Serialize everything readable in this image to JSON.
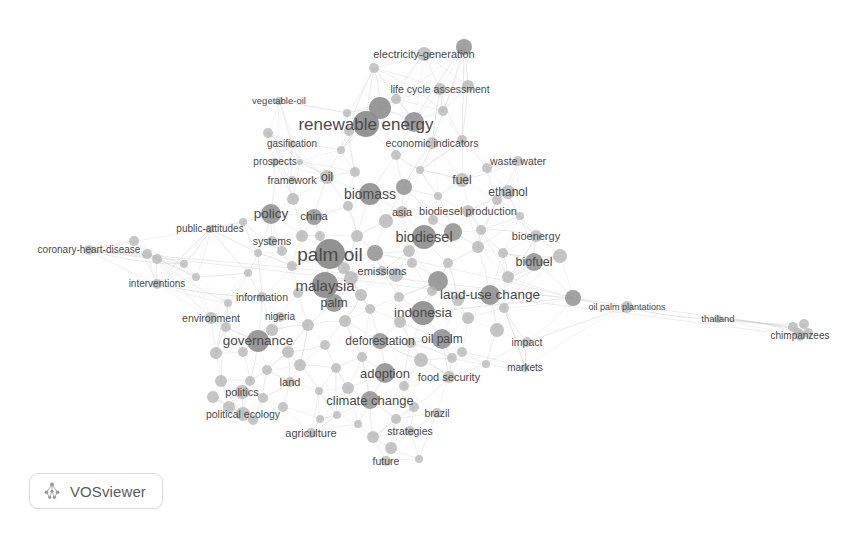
{
  "app": {
    "name": "VOSviewer",
    "badge_label": "VOSviewer",
    "badge_icon": "vosviewer-logo-icon",
    "view_type": "network-visualization",
    "background_color": "#ffffff"
  },
  "chart_data": {
    "type": "scatter",
    "title": "",
    "subtitle": "",
    "xlabel": "",
    "ylabel": "",
    "grid": false,
    "legend_position": "none",
    "axis_visible": false,
    "colors": {
      "node_fill": "#8e8e8e",
      "node_fill_light": "#b4b4b4",
      "edge": "#c9c9c9",
      "label_text": "#4a4a4a",
      "background": "#ffffff"
    },
    "map_notes": "Bibliometric co-occurrence network of palm oil research keywords rendered in grayscale.",
    "nodes": [
      {
        "label": "electricity-generation",
        "x": 424,
        "y": 54,
        "r": 7,
        "font": 11,
        "lx": 424,
        "ly": 54
      },
      {
        "label": "",
        "x": 374,
        "y": 68,
        "r": 5,
        "font": 0,
        "lx": 374,
        "ly": 68
      },
      {
        "label": "",
        "x": 464,
        "y": 47,
        "r": 8,
        "font": 0,
        "lx": 464,
        "ly": 47
      },
      {
        "label": "life cycle assessment",
        "x": 440,
        "y": 89,
        "r": 6,
        "font": 10.5,
        "lx": 440,
        "ly": 89
      },
      {
        "label": "",
        "x": 468,
        "y": 86,
        "r": 6,
        "font": 0,
        "lx": 468,
        "ly": 86
      },
      {
        "label": "vegetable-oil",
        "x": 279,
        "y": 101,
        "r": 4,
        "font": 9.5,
        "lx": 279,
        "ly": 101
      },
      {
        "label": "",
        "x": 380,
        "y": 108,
        "r": 11,
        "font": 0,
        "lx": 380,
        "ly": 108
      },
      {
        "label": "renewable energy",
        "x": 366,
        "y": 124,
        "r": 13,
        "font": 17,
        "lx": 366,
        "ly": 124
      },
      {
        "label": "",
        "x": 414,
        "y": 122,
        "r": 10,
        "font": 0,
        "lx": 414,
        "ly": 122
      },
      {
        "label": "",
        "x": 268,
        "y": 133,
        "r": 5,
        "font": 0,
        "lx": 268,
        "ly": 133
      },
      {
        "label": "gasification",
        "x": 292,
        "y": 144,
        "r": 4,
        "font": 10,
        "lx": 292,
        "ly": 144
      },
      {
        "label": "economic indicators",
        "x": 432,
        "y": 143,
        "r": 6,
        "font": 10.5,
        "lx": 432,
        "ly": 143
      },
      {
        "label": "",
        "x": 462,
        "y": 140,
        "r": 5,
        "font": 0,
        "lx": 462,
        "ly": 140
      },
      {
        "label": "prospects",
        "x": 275,
        "y": 162,
        "r": 4,
        "font": 10,
        "lx": 275,
        "ly": 162
      },
      {
        "label": "waste water",
        "x": 518,
        "y": 161,
        "r": 5,
        "font": 10.5,
        "lx": 518,
        "ly": 161
      },
      {
        "label": "framework",
        "x": 292,
        "y": 180,
        "r": 4,
        "font": 10.5,
        "lx": 292,
        "ly": 180
      },
      {
        "label": "oil",
        "x": 327,
        "y": 177,
        "r": 7,
        "font": 12,
        "lx": 327,
        "ly": 177
      },
      {
        "label": "fuel",
        "x": 462,
        "y": 180,
        "r": 7,
        "font": 12,
        "lx": 462,
        "ly": 180
      },
      {
        "label": "biomass",
        "x": 370,
        "y": 194,
        "r": 11,
        "font": 14,
        "lx": 370,
        "ly": 194
      },
      {
        "label": "",
        "x": 404,
        "y": 187,
        "r": 8,
        "font": 0,
        "lx": 404,
        "ly": 187
      },
      {
        "label": "ethanol",
        "x": 508,
        "y": 192,
        "r": 7,
        "font": 12,
        "lx": 508,
        "ly": 192
      },
      {
        "label": "",
        "x": 438,
        "y": 196,
        "r": 4,
        "font": 0,
        "lx": 438,
        "ly": 196
      },
      {
        "label": "public-attitudes",
        "x": 210,
        "y": 229,
        "r": 4,
        "font": 10,
        "lx": 210,
        "ly": 229
      },
      {
        "label": "policy",
        "x": 271,
        "y": 214,
        "r": 10,
        "font": 13.5,
        "lx": 271,
        "ly": 214
      },
      {
        "label": "china",
        "x": 314,
        "y": 217,
        "r": 8,
        "font": 11.5,
        "lx": 314,
        "ly": 217
      },
      {
        "label": "asia",
        "x": 402,
        "y": 212,
        "r": 6,
        "font": 11,
        "lx": 402,
        "ly": 212
      },
      {
        "label": "biodiesel production",
        "x": 468,
        "y": 211,
        "r": 6,
        "font": 11,
        "lx": 468,
        "ly": 211
      },
      {
        "label": "biodiesel",
        "x": 424,
        "y": 237,
        "r": 12,
        "font": 14.5,
        "lx": 424,
        "ly": 237
      },
      {
        "label": "",
        "x": 453,
        "y": 232,
        "r": 9,
        "font": 0,
        "lx": 453,
        "ly": 232
      },
      {
        "label": "bioenergy",
        "x": 536,
        "y": 236,
        "r": 6,
        "font": 11,
        "lx": 536,
        "ly": 236
      },
      {
        "label": "systems",
        "x": 272,
        "y": 241,
        "r": 5,
        "font": 10.5,
        "lx": 272,
        "ly": 241
      },
      {
        "label": "coronary-heart-disease",
        "x": 89,
        "y": 250,
        "r": 5,
        "font": 10,
        "lx": 89,
        "ly": 250
      },
      {
        "label": "",
        "x": 134,
        "y": 241,
        "r": 5,
        "font": 0,
        "lx": 134,
        "ly": 241
      },
      {
        "label": "",
        "x": 147,
        "y": 254,
        "r": 5,
        "font": 0,
        "lx": 147,
        "ly": 254
      },
      {
        "label": "",
        "x": 157,
        "y": 259,
        "r": 5,
        "font": 0,
        "lx": 157,
        "ly": 259
      },
      {
        "label": "palm oil",
        "x": 330,
        "y": 254,
        "r": 15,
        "font": 19,
        "lx": 330,
        "ly": 254
      },
      {
        "label": "",
        "x": 375,
        "y": 253,
        "r": 8,
        "font": 0,
        "lx": 375,
        "ly": 253
      },
      {
        "label": "biofuel",
        "x": 534,
        "y": 262,
        "r": 9,
        "font": 12.5,
        "lx": 534,
        "ly": 262
      },
      {
        "label": "",
        "x": 560,
        "y": 256,
        "r": 7,
        "font": 0,
        "lx": 560,
        "ly": 256
      },
      {
        "label": "emissions",
        "x": 382,
        "y": 271,
        "r": 5,
        "font": 11,
        "lx": 382,
        "ly": 271
      },
      {
        "label": "",
        "x": 396,
        "y": 275,
        "r": 7,
        "font": 0,
        "lx": 396,
        "ly": 275
      },
      {
        "label": "interventions",
        "x": 157,
        "y": 284,
        "r": 5,
        "font": 10,
        "lx": 157,
        "ly": 284
      },
      {
        "label": "malaysia",
        "x": 325,
        "y": 285,
        "r": 13,
        "font": 15,
        "lx": 325,
        "ly": 285
      },
      {
        "label": "",
        "x": 351,
        "y": 278,
        "r": 7,
        "font": 0,
        "lx": 351,
        "ly": 278
      },
      {
        "label": "land-use change",
        "x": 490,
        "y": 295,
        "r": 10,
        "font": 13.5,
        "lx": 490,
        "ly": 295
      },
      {
        "label": "",
        "x": 438,
        "y": 281,
        "r": 10,
        "font": 0,
        "lx": 438,
        "ly": 281
      },
      {
        "label": "information",
        "x": 262,
        "y": 297,
        "r": 5,
        "font": 10.5,
        "lx": 262,
        "ly": 297
      },
      {
        "label": "palm",
        "x": 334,
        "y": 303,
        "r": 9,
        "font": 12.5,
        "lx": 334,
        "ly": 303
      },
      {
        "label": "indonesia",
        "x": 423,
        "y": 313,
        "r": 12,
        "font": 13.5,
        "lx": 423,
        "ly": 313
      },
      {
        "label": "environment",
        "x": 211,
        "y": 318,
        "r": 6,
        "font": 10.5,
        "lx": 211,
        "ly": 318
      },
      {
        "label": "nigeria",
        "x": 280,
        "y": 317,
        "r": 5,
        "font": 10,
        "lx": 280,
        "ly": 317
      },
      {
        "label": "oil palm plantations",
        "x": 627,
        "y": 307,
        "r": 6,
        "font": 9,
        "lx": 627,
        "ly": 307
      },
      {
        "label": "",
        "x": 573,
        "y": 298,
        "r": 8,
        "font": 0,
        "lx": 573,
        "ly": 298
      },
      {
        "label": "thailand",
        "x": 718,
        "y": 319,
        "r": 4,
        "font": 9.5,
        "lx": 718,
        "ly": 319
      },
      {
        "label": "chimpanzees",
        "x": 800,
        "y": 336,
        "r": 5,
        "font": 10,
        "lx": 800,
        "ly": 336
      },
      {
        "label": "",
        "x": 793,
        "y": 327,
        "r": 5,
        "font": 0,
        "lx": 793,
        "ly": 327
      },
      {
        "label": "",
        "x": 804,
        "y": 324,
        "r": 5,
        "font": 0,
        "lx": 804,
        "ly": 324
      },
      {
        "label": "",
        "x": 798,
        "y": 333,
        "r": 5,
        "font": 0,
        "lx": 798,
        "ly": 333
      },
      {
        "label": "",
        "x": 808,
        "y": 333,
        "r": 5,
        "font": 0,
        "lx": 808,
        "ly": 333
      },
      {
        "label": "governance",
        "x": 258,
        "y": 341,
        "r": 11,
        "font": 13.5,
        "lx": 258,
        "ly": 341
      },
      {
        "label": "deforestation",
        "x": 380,
        "y": 341,
        "r": 8,
        "font": 12,
        "lx": 380,
        "ly": 341
      },
      {
        "label": "oil palm",
        "x": 442,
        "y": 339,
        "r": 10,
        "font": 12,
        "lx": 442,
        "ly": 339
      },
      {
        "label": "impact",
        "x": 527,
        "y": 342,
        "r": 5,
        "font": 10.5,
        "lx": 527,
        "ly": 342
      },
      {
        "label": "",
        "x": 497,
        "y": 330,
        "r": 7,
        "font": 0,
        "lx": 497,
        "ly": 330
      },
      {
        "label": "markets",
        "x": 525,
        "y": 368,
        "r": 4,
        "font": 10,
        "lx": 525,
        "ly": 368
      },
      {
        "label": "adoption",
        "x": 385,
        "y": 373,
        "r": 10,
        "font": 13,
        "lx": 385,
        "ly": 373
      },
      {
        "label": "food security",
        "x": 449,
        "y": 377,
        "r": 6,
        "font": 11,
        "lx": 449,
        "ly": 377
      },
      {
        "label": "",
        "x": 421,
        "y": 360,
        "r": 7,
        "font": 0,
        "lx": 421,
        "ly": 360
      },
      {
        "label": "politics",
        "x": 242,
        "y": 392,
        "r": 7,
        "font": 11,
        "lx": 242,
        "ly": 392
      },
      {
        "label": "land",
        "x": 290,
        "y": 382,
        "r": 5,
        "font": 11,
        "lx": 290,
        "ly": 382
      },
      {
        "label": "climate change",
        "x": 370,
        "y": 400,
        "r": 9,
        "font": 13,
        "lx": 370,
        "ly": 400
      },
      {
        "label": "brazil",
        "x": 437,
        "y": 413,
        "r": 5,
        "font": 10.5,
        "lx": 437,
        "ly": 413
      },
      {
        "label": "political ecology",
        "x": 243,
        "y": 414,
        "r": 7,
        "font": 10.5,
        "lx": 243,
        "ly": 414
      },
      {
        "label": "agriculture",
        "x": 311,
        "y": 433,
        "r": 5,
        "font": 11,
        "lx": 311,
        "ly": 433
      },
      {
        "label": "strategies",
        "x": 410,
        "y": 431,
        "r": 5,
        "font": 10.5,
        "lx": 410,
        "ly": 431
      },
      {
        "label": "future",
        "x": 386,
        "y": 461,
        "r": 5,
        "font": 10.5,
        "lx": 386,
        "ly": 461
      }
    ],
    "extra_nodes": [
      {
        "x": 347,
        "y": 113,
        "r": 4
      },
      {
        "x": 300,
        "y": 162,
        "r": 3
      },
      {
        "x": 341,
        "y": 150,
        "r": 4
      },
      {
        "x": 396,
        "y": 155,
        "r": 5
      },
      {
        "x": 355,
        "y": 172,
        "r": 5
      },
      {
        "x": 420,
        "y": 170,
        "r": 4
      },
      {
        "x": 487,
        "y": 168,
        "r": 5
      },
      {
        "x": 293,
        "y": 199,
        "r": 6
      },
      {
        "x": 348,
        "y": 206,
        "r": 5
      },
      {
        "x": 386,
        "y": 221,
        "r": 7
      },
      {
        "x": 497,
        "y": 200,
        "r": 5
      },
      {
        "x": 520,
        "y": 216,
        "r": 4
      },
      {
        "x": 243,
        "y": 222,
        "r": 4
      },
      {
        "x": 302,
        "y": 236,
        "r": 6
      },
      {
        "x": 357,
        "y": 236,
        "r": 6
      },
      {
        "x": 409,
        "y": 251,
        "r": 6
      },
      {
        "x": 478,
        "y": 247,
        "r": 6
      },
      {
        "x": 292,
        "y": 266,
        "r": 5
      },
      {
        "x": 344,
        "y": 268,
        "r": 6
      },
      {
        "x": 412,
        "y": 263,
        "r": 5
      },
      {
        "x": 508,
        "y": 277,
        "r": 6
      },
      {
        "x": 248,
        "y": 273,
        "r": 4
      },
      {
        "x": 298,
        "y": 293,
        "r": 5
      },
      {
        "x": 361,
        "y": 295,
        "r": 6
      },
      {
        "x": 399,
        "y": 297,
        "r": 5
      },
      {
        "x": 458,
        "y": 300,
        "r": 6
      },
      {
        "x": 228,
        "y": 303,
        "r": 4
      },
      {
        "x": 272,
        "y": 330,
        "r": 6
      },
      {
        "x": 308,
        "y": 325,
        "r": 6
      },
      {
        "x": 345,
        "y": 321,
        "r": 6
      },
      {
        "x": 400,
        "y": 322,
        "r": 6
      },
      {
        "x": 468,
        "y": 318,
        "r": 6
      },
      {
        "x": 226,
        "y": 327,
        "r": 5
      },
      {
        "x": 243,
        "y": 352,
        "r": 5
      },
      {
        "x": 288,
        "y": 352,
        "r": 6
      },
      {
        "x": 325,
        "y": 345,
        "r": 5
      },
      {
        "x": 362,
        "y": 357,
        "r": 5
      },
      {
        "x": 411,
        "y": 343,
        "r": 5
      },
      {
        "x": 462,
        "y": 352,
        "r": 5
      },
      {
        "x": 216,
        "y": 353,
        "r": 6
      },
      {
        "x": 267,
        "y": 370,
        "r": 5
      },
      {
        "x": 300,
        "y": 365,
        "r": 6
      },
      {
        "x": 336,
        "y": 368,
        "r": 5
      },
      {
        "x": 404,
        "y": 386,
        "r": 5
      },
      {
        "x": 221,
        "y": 381,
        "r": 6
      },
      {
        "x": 250,
        "y": 381,
        "r": 5
      },
      {
        "x": 213,
        "y": 397,
        "r": 6
      },
      {
        "x": 263,
        "y": 398,
        "r": 5
      },
      {
        "x": 319,
        "y": 391,
        "r": 4
      },
      {
        "x": 348,
        "y": 388,
        "r": 6
      },
      {
        "x": 229,
        "y": 407,
        "r": 6
      },
      {
        "x": 283,
        "y": 407,
        "r": 5
      },
      {
        "x": 337,
        "y": 415,
        "r": 4
      },
      {
        "x": 396,
        "y": 419,
        "r": 5
      },
      {
        "x": 253,
        "y": 420,
        "r": 5
      },
      {
        "x": 358,
        "y": 424,
        "r": 4
      },
      {
        "x": 373,
        "y": 437,
        "r": 6
      },
      {
        "x": 320,
        "y": 419,
        "r": 4
      },
      {
        "x": 391,
        "y": 448,
        "r": 6
      },
      {
        "x": 414,
        "y": 407,
        "r": 5
      },
      {
        "x": 452,
        "y": 358,
        "r": 5
      },
      {
        "x": 486,
        "y": 364,
        "r": 4
      },
      {
        "x": 282,
        "y": 251,
        "r": 5
      },
      {
        "x": 258,
        "y": 253,
        "r": 4
      },
      {
        "x": 433,
        "y": 220,
        "r": 5
      },
      {
        "x": 448,
        "y": 263,
        "r": 5
      },
      {
        "x": 370,
        "y": 309,
        "r": 5
      },
      {
        "x": 432,
        "y": 291,
        "r": 5
      },
      {
        "x": 504,
        "y": 308,
        "r": 5
      },
      {
        "x": 320,
        "y": 236,
        "r": 5
      },
      {
        "x": 184,
        "y": 264,
        "r": 4
      },
      {
        "x": 196,
        "y": 277,
        "r": 4
      },
      {
        "x": 349,
        "y": 131,
        "r": 5
      },
      {
        "x": 443,
        "y": 111,
        "r": 5
      },
      {
        "x": 396,
        "y": 99,
        "r": 5
      },
      {
        "x": 481,
        "y": 230,
        "r": 5
      },
      {
        "x": 503,
        "y": 253,
        "r": 5
      },
      {
        "x": 419,
        "y": 459,
        "r": 4
      }
    ]
  }
}
